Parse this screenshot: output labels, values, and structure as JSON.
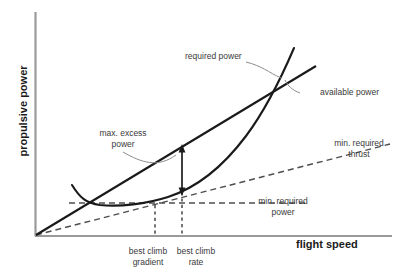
{
  "figure": {
    "type": "diagram",
    "axes": {
      "y_title": "propulsive power",
      "x_title": "flight speed",
      "origin_marked": true,
      "ticks": false,
      "grid": false
    },
    "curves": [
      {
        "name": "required power",
        "style": "solid",
        "color": "#1a1a1a",
        "shape": "parabola-like curve with minimum, rising steeply at high speed"
      },
      {
        "name": "available power",
        "style": "solid",
        "color": "#1a1a1a",
        "shape": "straight line through origin, shallower slope"
      },
      {
        "name": "min. required thrust",
        "style": "dashed",
        "color": "#555555",
        "shape": "straight line through origin, tangent to required power curve"
      },
      {
        "name": "min. required power",
        "style": "dashed",
        "color": "#555555",
        "shape": "horizontal line at the minimum of the required power curve"
      }
    ],
    "annotations": {
      "required_power": "required power",
      "available_power": "available power",
      "max_excess_power": "max. excess\npower",
      "max_excess_power_line1": "max. excess",
      "max_excess_power_line2": "power",
      "min_required_thrust_line1": "min. required",
      "min_required_thrust_line2": "thrust",
      "min_required_power_line1": "min. required",
      "min_required_power_line2": "power",
      "best_climb_gradient_line1": "best climb",
      "best_climb_gradient_line2": "gradient",
      "best_climb_rate_line1": "best climb",
      "best_climb_rate_line2": "rate"
    },
    "markers": {
      "excess_power_arrow": "double-headed vertical arrow between available power line and required power curve",
      "best_climb_gradient_dropline": "vertical dashed line at tangency point of min. required thrust",
      "best_climb_rate_dropline": "vertical dashed line at point of maximum excess power"
    },
    "colors": {
      "line": "#1a1a1a",
      "dashed": "#555555",
      "axis": "#9a9a9a",
      "text": "#3a3a3a",
      "axis_title": "#1a1a1a",
      "background": "#ffffff",
      "leader": "#8c8c8c"
    }
  }
}
